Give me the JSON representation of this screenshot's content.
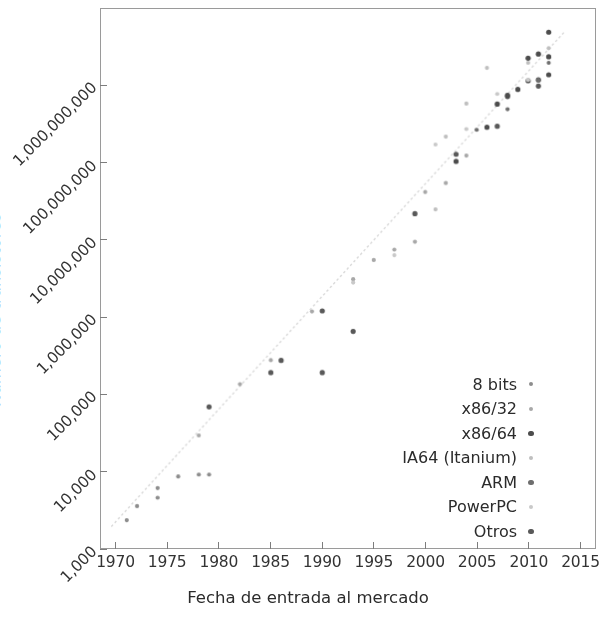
{
  "chart_data": {
    "type": "scatter",
    "title": "",
    "xlabel": "Fecha de entrada al mercado",
    "ylabel": "Número de transistores",
    "xlim": [
      1968.5,
      2016.5
    ],
    "ylim": [
      1000,
      10000000000
    ],
    "yscale": "log",
    "xscale": "linear",
    "grid": false,
    "legend_position": "center-right",
    "xticks": [
      "1970",
      "1975",
      "1980",
      "1985",
      "1990",
      "1995",
      "2000",
      "2005",
      "2010",
      "2015"
    ],
    "xtick_values": [
      1970,
      1975,
      1980,
      1985,
      1990,
      1995,
      2000,
      2005,
      2010,
      2015
    ],
    "yticks": [
      "1,000",
      "10,000",
      "100,000",
      "1,000,000",
      "10,000,000",
      "100,000,000",
      "1,000,000,000"
    ],
    "ytick_values": [
      1000,
      10000,
      100000,
      1000000,
      10000000,
      100000000,
      1000000000
    ],
    "trendline": {
      "name": "Ley de Moore",
      "color": "#d9d9d9",
      "x": [
        1969.5,
        2013.5
      ],
      "y": [
        1900,
        5000000000
      ]
    },
    "series": [
      {
        "name": "8 bits",
        "color": "#8d8d8d",
        "marker": "o",
        "marker_size": 3,
        "points": [
          {
            "x": 1971,
            "y": 2300
          },
          {
            "x": 1972,
            "y": 3500
          },
          {
            "x": 1974,
            "y": 4500
          },
          {
            "x": 1974,
            "y": 6000
          },
          {
            "x": 1976,
            "y": 8500
          },
          {
            "x": 1978,
            "y": 9000
          },
          {
            "x": 1979,
            "y": 9000
          }
        ]
      },
      {
        "name": "x86/32",
        "color": "#a8a8a8",
        "marker": "o",
        "marker_size": 3,
        "points": [
          {
            "x": 1978,
            "y": 29000
          },
          {
            "x": 1982,
            "y": 134000
          },
          {
            "x": 1985,
            "y": 275000
          },
          {
            "x": 1989,
            "y": 1180000
          },
          {
            "x": 1993,
            "y": 3100000
          },
          {
            "x": 1995,
            "y": 5500000
          },
          {
            "x": 1997,
            "y": 7500000
          },
          {
            "x": 1999,
            "y": 9500000
          },
          {
            "x": 2000,
            "y": 42000000
          },
          {
            "x": 2002,
            "y": 55000000
          },
          {
            "x": 2004,
            "y": 125000000
          }
        ]
      },
      {
        "name": "x86/64",
        "color": "#4c4c4c",
        "marker": "o",
        "marker_size": 4,
        "points": [
          {
            "x": 2003,
            "y": 105000000
          },
          {
            "x": 2006,
            "y": 291000000
          },
          {
            "x": 2007,
            "y": 582000000
          },
          {
            "x": 2008,
            "y": 731000000
          },
          {
            "x": 2008,
            "y": 758000000
          },
          {
            "x": 2009,
            "y": 904000000
          },
          {
            "x": 2010,
            "y": 1170000000
          },
          {
            "x": 2010,
            "y": 2300000000
          },
          {
            "x": 2011,
            "y": 1200000000
          },
          {
            "x": 2011,
            "y": 2600000000
          },
          {
            "x": 2012,
            "y": 1400000000
          },
          {
            "x": 2012,
            "y": 2400000000
          },
          {
            "x": 2012,
            "y": 5000000000
          }
        ]
      },
      {
        "name": "IA64 (Itanium)",
        "color": "#bfbfbf",
        "marker": "o",
        "marker_size": 3,
        "points": [
          {
            "x": 2001,
            "y": 25000000
          },
          {
            "x": 2002,
            "y": 220000000
          },
          {
            "x": 2004,
            "y": 592000000
          },
          {
            "x": 2006,
            "y": 1720000000
          },
          {
            "x": 2010,
            "y": 2000000000
          },
          {
            "x": 2012,
            "y": 3100000000
          }
        ]
      },
      {
        "name": "ARM",
        "color": "#6e6e6e",
        "marker": "o",
        "marker_size": 3,
        "points": [
          {
            "x": 2005,
            "y": 270000000
          },
          {
            "x": 2008,
            "y": 500000000
          },
          {
            "x": 2011,
            "y": 1200000000
          },
          {
            "x": 2012,
            "y": 2000000000
          }
        ]
      },
      {
        "name": "PowerPC",
        "color": "#c9c9c9",
        "marker": "o",
        "marker_size": 3,
        "points": [
          {
            "x": 1993,
            "y": 2800000
          },
          {
            "x": 1997,
            "y": 6350000
          },
          {
            "x": 2001,
            "y": 174000000
          },
          {
            "x": 2004,
            "y": 276000000
          },
          {
            "x": 2007,
            "y": 789000000
          },
          {
            "x": 2010,
            "y": 1200000000
          }
        ]
      },
      {
        "name": "Otros",
        "color": "#595959",
        "marker": "o",
        "marker_size": 4,
        "points": [
          {
            "x": 1979,
            "y": 68000
          },
          {
            "x": 1985,
            "y": 190000
          },
          {
            "x": 1986,
            "y": 273000
          },
          {
            "x": 1990,
            "y": 190000
          },
          {
            "x": 1990,
            "y": 1200000
          },
          {
            "x": 1993,
            "y": 650000
          },
          {
            "x": 1999,
            "y": 22000000
          },
          {
            "x": 2003,
            "y": 130000000
          },
          {
            "x": 2007,
            "y": 300000000
          },
          {
            "x": 2011,
            "y": 1000000000
          }
        ]
      }
    ]
  },
  "axes": {
    "xlabel": "Fecha de entrada al mercado",
    "ylabel": "Número de transistores"
  },
  "legend": {
    "items": [
      {
        "label": "8 bits",
        "color": "#8d8d8d",
        "size": 3
      },
      {
        "label": "x86/32",
        "color": "#a8a8a8",
        "size": 3
      },
      {
        "label": "x86/64",
        "color": "#4c4c4c",
        "size": 4
      },
      {
        "label": "IA64 (Itanium)",
        "color": "#bfbfbf",
        "size": 3
      },
      {
        "label": "ARM",
        "color": "#6e6e6e",
        "size": 4
      },
      {
        "label": "PowerPC",
        "color": "#c9c9c9",
        "size": 3
      },
      {
        "label": "Otros",
        "color": "#595959",
        "size": 4
      }
    ]
  },
  "style": {
    "frame_color": "#9a9a9a",
    "tick_color": "#7d7d7d",
    "text_color": "#2b2b2b",
    "background": "#ffffff"
  }
}
